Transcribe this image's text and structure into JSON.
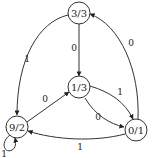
{
  "diagram": {
    "type": "state-transition-graph",
    "nodes": [
      {
        "id": "n33",
        "label": "3/3"
      },
      {
        "id": "n13",
        "label": "1/3"
      },
      {
        "id": "n92",
        "label": "9/2"
      },
      {
        "id": "n01",
        "label": "0/1"
      }
    ],
    "edges": [
      {
        "from": "n33",
        "to": "n13",
        "label": "0"
      },
      {
        "from": "n33",
        "to": "n92",
        "label": "1"
      },
      {
        "from": "n01",
        "to": "n33",
        "label": "0"
      },
      {
        "from": "n92",
        "to": "n13",
        "label": "0"
      },
      {
        "from": "n13",
        "to": "n01",
        "label": "1"
      },
      {
        "from": "n13",
        "to": "n01",
        "label": "0"
      },
      {
        "from": "n01",
        "to": "n92",
        "label": "1"
      },
      {
        "from": "n92",
        "to": "n92",
        "label": "1"
      }
    ]
  }
}
